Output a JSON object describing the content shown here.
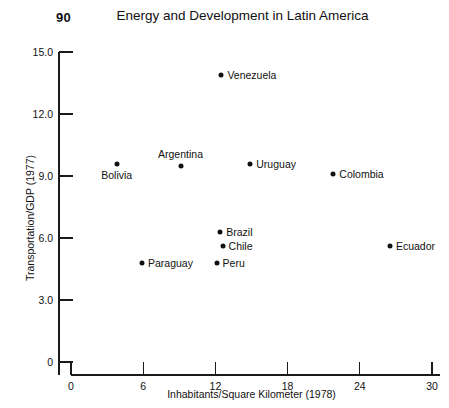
{
  "page": {
    "number": "90"
  },
  "chart_data": {
    "type": "scatter",
    "title": "Energy and Development in Latin America",
    "xlabel": "Inhabitants/Square Kilometer (1978)",
    "ylabel": "Transportation/GDP (1977)",
    "xlim": [
      0,
      30
    ],
    "ylim": [
      0,
      15
    ],
    "xticks": [
      "0",
      "6",
      "12",
      "18",
      "24",
      "30"
    ],
    "xtick_values": [
      0,
      6,
      12,
      18,
      24,
      30
    ],
    "yticks": [
      "0",
      "3.0",
      "6.0",
      "9.0",
      "12.0",
      "15.0"
    ],
    "ytick_values": [
      0,
      3,
      6,
      9,
      12,
      15
    ],
    "grid": false,
    "legend": false,
    "points": [
      {
        "label": "Venezuela",
        "x": 12.5,
        "y": 13.9,
        "label_pos": "right"
      },
      {
        "label": "Uruguay",
        "x": 14.9,
        "y": 9.6,
        "label_pos": "right"
      },
      {
        "label": "Bolivia",
        "x": 3.8,
        "y": 9.6,
        "label_pos": "below"
      },
      {
        "label": "Argentina",
        "x": 9.1,
        "y": 9.5,
        "label_pos": "above"
      },
      {
        "label": "Colombia",
        "x": 21.8,
        "y": 9.1,
        "label_pos": "right"
      },
      {
        "label": "Brazil",
        "x": 12.4,
        "y": 6.3,
        "label_pos": "right"
      },
      {
        "label": "Chile",
        "x": 12.6,
        "y": 5.6,
        "label_pos": "right"
      },
      {
        "label": "Ecuador",
        "x": 26.5,
        "y": 5.6,
        "label_pos": "right"
      },
      {
        "label": "Peru",
        "x": 12.1,
        "y": 4.8,
        "label_pos": "right"
      },
      {
        "label": "Paraguay",
        "x": 5.9,
        "y": 4.8,
        "label_pos": "right"
      }
    ]
  },
  "colors": {
    "axis": "#1a1a1a",
    "marker": "#111111",
    "background": "#ffffff"
  }
}
